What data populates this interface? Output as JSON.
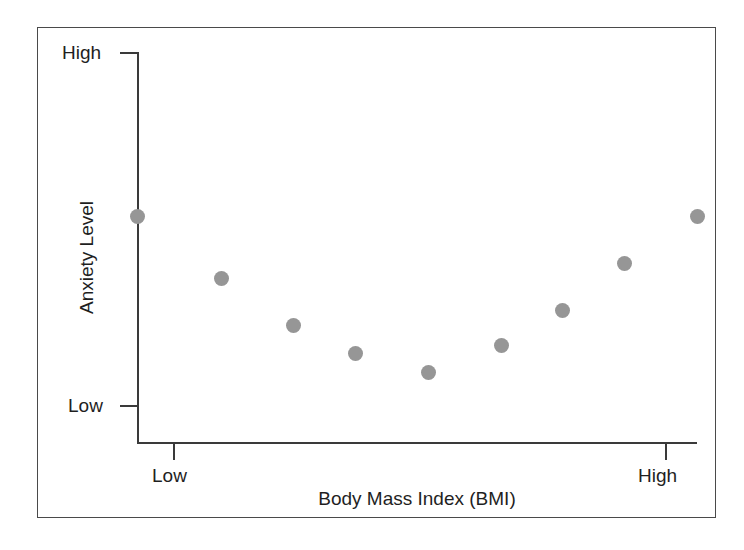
{
  "figure": {
    "border_color": "#4a4a4a",
    "axis_color": "#3a3a3a",
    "background": "#ffffff"
  },
  "axes": {
    "y_title": "Anxiety Level",
    "x_title": "Body Mass Index (BMI)",
    "y_tick_high": "High",
    "y_tick_low": "Low",
    "x_tick_low": "Low",
    "x_tick_high": "High"
  },
  "chart_data": {
    "type": "scatter",
    "title": "",
    "subtitle": "",
    "xlabel": "Body Mass Index (BMI)",
    "ylabel": "Anxiety Level",
    "xlim": [
      0,
      1
    ],
    "ylim": [
      0,
      1
    ],
    "xtick_positions": [
      0,
      1
    ],
    "xtick_labels": [
      "Low",
      "High"
    ],
    "ytick_positions": [
      0,
      1
    ],
    "ytick_labels": [
      "Low",
      "High"
    ],
    "grid": false,
    "legend": null,
    "annotations": [],
    "marker": {
      "shape": "circle",
      "color": "#969696",
      "size_px": 15
    },
    "relationship": "U-shaped (quadratic): anxiety is high at both low and high BMI and lowest at mid BMI",
    "series": [
      {
        "name": "Anxiety Level vs BMI",
        "color": "#969696",
        "points": [
          {
            "x": 0.0,
            "y": 0.58
          },
          {
            "x": 0.15,
            "y": 0.42
          },
          {
            "x": 0.28,
            "y": 0.3
          },
          {
            "x": 0.39,
            "y": 0.23
          },
          {
            "x": 0.52,
            "y": 0.18
          },
          {
            "x": 0.65,
            "y": 0.25
          },
          {
            "x": 0.76,
            "y": 0.34
          },
          {
            "x": 0.87,
            "y": 0.46
          },
          {
            "x": 1.0,
            "y": 0.58
          }
        ]
      }
    ]
  }
}
